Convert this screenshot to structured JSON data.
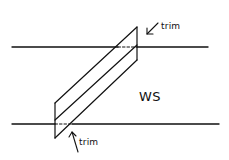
{
  "diagram": {
    "labels": {
      "trim_top": "trim",
      "trim_bottom": "trim",
      "region": "WS"
    },
    "colors": {
      "stroke": "#111111",
      "background": "#ffffff"
    },
    "elements": {
      "horizontal_lines": 2,
      "parallelogram_strips": 2,
      "dashed_crossings": 2,
      "arrows": 2
    }
  }
}
